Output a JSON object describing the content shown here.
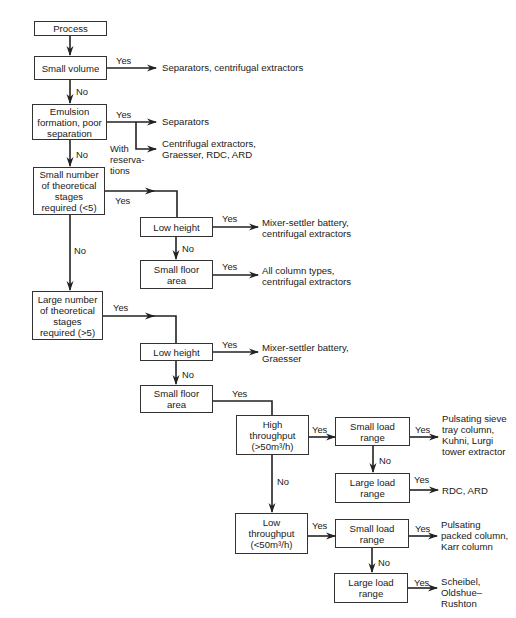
{
  "diagram": {
    "type": "decision-flowchart",
    "nodes": {
      "process": "Process",
      "small_volume": "Small volume",
      "emulsion": "Emulsion\nformation, poor\nseparation",
      "small_stages": "Small number\nof theoretical\nstages\nrequired (<5)",
      "low_height_1": "Low height",
      "small_floor_1": "Small floor\narea",
      "large_stages": "Large number\nof theoretical\nstages\nrequired (>5)",
      "low_height_2": "Low height",
      "small_floor_2": "Small floor\narea",
      "high_throughput": "High\nthroughput\n(>50m³/h)",
      "small_load_1": "Small load\nrange",
      "large_load_1": "Large load\nrange",
      "low_throughput": "Low\nthroughput\n(<50m³/h)",
      "small_load_2": "Small load\nrange",
      "large_load_2": "Large load\nrange"
    },
    "edge_labels": {
      "yes": "Yes",
      "no": "No",
      "with_reservations": "With\nreserva-\ntions"
    },
    "outcomes": {
      "small_volume_yes": "Separators, centrifugal extractors",
      "emulsion_yes": "Separators",
      "emulsion_reservations": "Centrifugal extractors,\nGraesser, RDC, ARD",
      "low_height_1_yes": "Mixer-settler battery,\ncentrifugal extractors",
      "small_floor_1_yes": "All column types,\ncentrifugal extractors",
      "low_height_2_yes": "Mixer-settler battery,\nGraesser",
      "small_load_1_yes": "Pulsating sieve\ntray column,\nKuhni, Lurgi\ntower extractor",
      "large_load_1_yes": "RDC, ARD",
      "small_load_2_yes": "Pulsating\npacked column,\nKarr column",
      "large_load_2_yes": "Scheibel,\nOldshue–\nRushton"
    }
  }
}
